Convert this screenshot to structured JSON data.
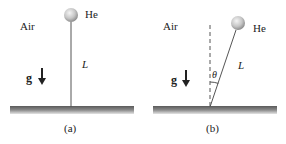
{
  "panels": [
    {
      "id": "a",
      "caption": "(a)",
      "medium_label": "Air",
      "gas_label": "He",
      "length_label": "L",
      "gravity_label": "g"
    },
    {
      "id": "b",
      "caption": "(b)",
      "medium_label": "Air",
      "gas_label": "He",
      "length_label": "L",
      "angle_label": "θ",
      "gravity_label": "g"
    }
  ],
  "colors": {
    "ground": "#6e6e6e",
    "string": "#555555",
    "balloon": "#c8c8c8",
    "text": "#222222"
  }
}
